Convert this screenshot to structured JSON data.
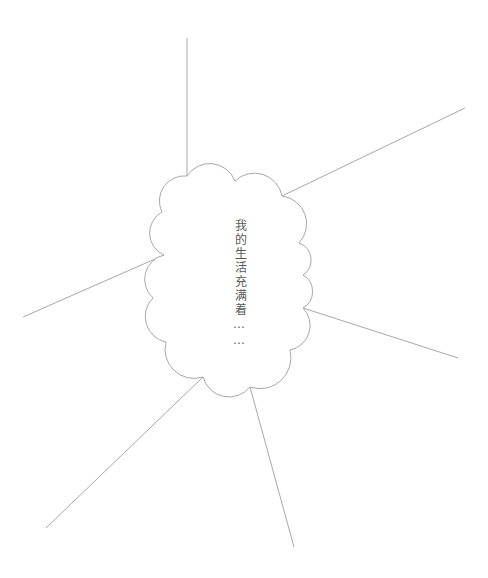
{
  "canvas": {
    "width": 488,
    "height": 578,
    "background": "#ffffff"
  },
  "diagram": {
    "type": "mind-map",
    "center_node": {
      "shape": "thought-cloud",
      "label": "我的生活充满着……",
      "text_orientation": "vertical",
      "text_color": "#5a5a5a",
      "stroke_color": "#a8a8a8",
      "fill_color": "#ffffff"
    },
    "line_color": "#a8a8a8",
    "branches": [
      {
        "name": "branch-top",
        "label": "",
        "x1": 187,
        "y1": 176,
        "x2": 187,
        "y2": 38
      },
      {
        "name": "branch-top-right",
        "label": "",
        "x1": 282,
        "y1": 196,
        "x2": 465,
        "y2": 108
      },
      {
        "name": "branch-right",
        "label": "",
        "x1": 303,
        "y1": 308,
        "x2": 458,
        "y2": 358
      },
      {
        "name": "branch-bottom-right",
        "label": "",
        "x1": 250,
        "y1": 387,
        "x2": 294,
        "y2": 547
      },
      {
        "name": "branch-bottom-left",
        "label": "",
        "x1": 203,
        "y1": 377,
        "x2": 46,
        "y2": 528
      },
      {
        "name": "branch-left",
        "label": "",
        "x1": 164,
        "y1": 255,
        "x2": 23,
        "y2": 317
      }
    ]
  }
}
